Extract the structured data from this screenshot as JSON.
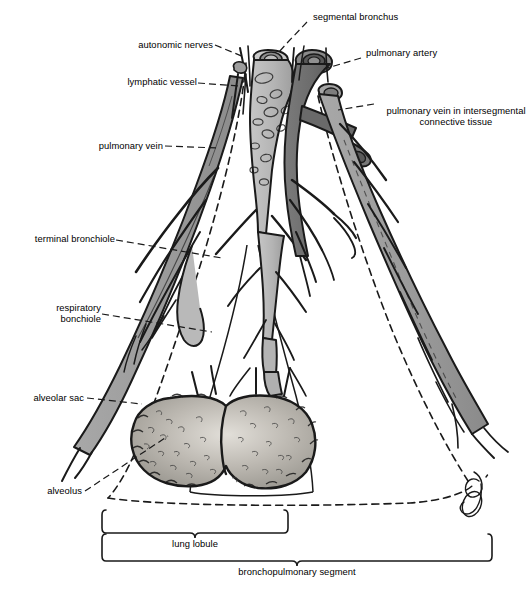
{
  "figure": {
    "style": "grayscale anatomical line illustration",
    "signature": "artist-signature-monogram"
  },
  "colors": {
    "outline": "#1a1a1a",
    "bronchus_fill": "#b9b9b9",
    "artery_fill": "#6f6f6f",
    "vein_fill": "#9a9a9a",
    "alveoli_fill": "#a8a5a0",
    "alveoli_highlight": "#d9d6d0",
    "background": "#ffffff",
    "text": "#000000"
  },
  "labels": {
    "segmental_bronchus": "segmental bronchus",
    "autonomic_nerves": "autonomic nerves",
    "pulmonary_artery": "pulmonary artery",
    "lymphatic_vessel": "lymphatic vessel",
    "pulmonary_vein_intersegmental": "pulmonary vein in\nintersegmental\nconnective tissue",
    "pulmonary_vein": "pulmonary vein",
    "terminal_bronchiole": "terminal bronchiole",
    "respiratory_bronchiole": "respiratory\nbonchiole",
    "alveolar_sac": "alveolar sac",
    "alveolus": "alveolus"
  },
  "brackets": {
    "lung_lobule": "lung lobule",
    "bronchopulmonary_segment": "bronchopulmonary segment"
  }
}
